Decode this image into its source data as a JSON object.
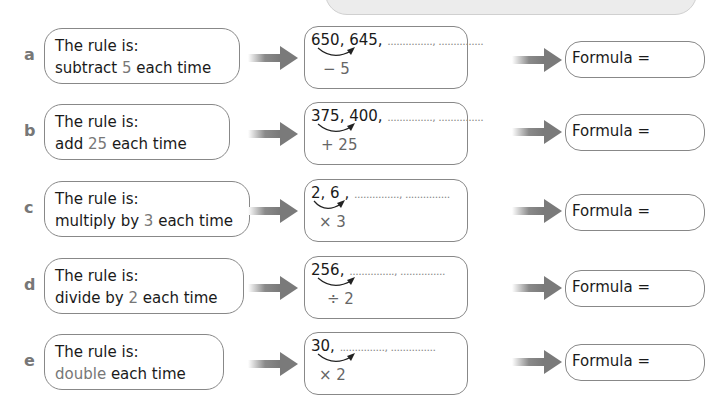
{
  "questions": [
    {
      "letter": "a",
      "rule_prefix": "The rule is:",
      "rule_pre": "subtract ",
      "rule_hl": "5",
      "rule_post": " each time",
      "sequence": "650, 645, ",
      "blanks": "..............., ...............",
      "operation": "− 5",
      "formula": "Formula ="
    },
    {
      "letter": "b",
      "rule_prefix": "The rule is:",
      "rule_pre": "add ",
      "rule_hl": "25",
      "rule_post": " each time",
      "sequence": "375, 400, ",
      "blanks": "..............., ...............",
      "operation": "+ 25",
      "formula": "Formula ="
    },
    {
      "letter": "c",
      "rule_prefix": "The rule is:",
      "rule_pre": "multiply by ",
      "rule_hl": "3",
      "rule_post": " each time",
      "sequence": "2, 6 , ",
      "blanks": "..............., ...............",
      "operation": "× 3",
      "formula": "Formula ="
    },
    {
      "letter": "d",
      "rule_prefix": "The rule is:",
      "rule_pre": "divide by ",
      "rule_hl": "2",
      "rule_post": " each time",
      "sequence": "256, ",
      "blanks": "..............., ...............",
      "operation": "÷ 2",
      "formula": "Formula ="
    },
    {
      "letter": "e",
      "rule_prefix": "The rule is:",
      "rule_pre": "",
      "rule_hl": "double",
      "rule_post": " each time",
      "sequence": "30, ",
      "blanks": "..............., ...............",
      "operation": "× 2",
      "formula": "Formula ="
    }
  ],
  "colors": {
    "highlight": "#777777",
    "border": "#888888",
    "arrow": "#7a7a7a"
  }
}
